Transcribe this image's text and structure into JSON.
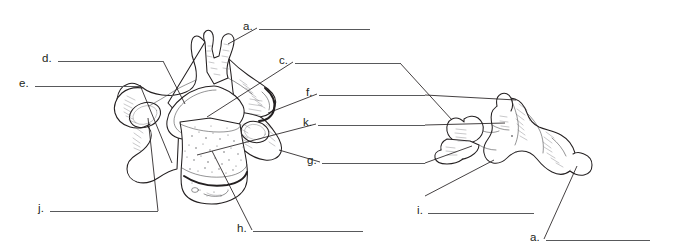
{
  "worksheet": {
    "title": "Vertebra labeling worksheet",
    "figures": [
      {
        "name": "cervical-vertebra-superior-view",
        "description": "Superior view of a cervical vertebra"
      },
      {
        "name": "cervical-vertebra-lateral-view",
        "description": "Lateral view of a cervical vertebra"
      }
    ],
    "colors": {
      "ink": "#231f20",
      "rule": "#58595b",
      "background": "#ffffff"
    },
    "labels": [
      {
        "key": "a_top",
        "letter": "a.",
        "x": 243,
        "y": 21,
        "line_x": 259,
        "line_y": 29,
        "line_w": 111
      },
      {
        "key": "d",
        "letter": "d.",
        "x": 42,
        "y": 53,
        "line_x": 58,
        "line_y": 61,
        "line_w": 105
      },
      {
        "key": "c",
        "letter": "c.",
        "x": 279,
        "y": 55,
        "line_x": 295,
        "line_y": 63,
        "line_w": 105
      },
      {
        "key": "e",
        "letter": "e.",
        "x": 19,
        "y": 78,
        "line_x": 35,
        "line_y": 86,
        "line_w": 105
      },
      {
        "key": "f",
        "letter": "f.",
        "x": 306,
        "y": 87,
        "line_x": 319,
        "line_y": 95,
        "line_w": 106
      },
      {
        "key": "k",
        "letter": "k.",
        "x": 303,
        "y": 117,
        "line_x": 318,
        "line_y": 125,
        "line_w": 107
      },
      {
        "key": "g",
        "letter": "g.",
        "x": 307,
        "y": 155,
        "line_x": 322,
        "line_y": 163,
        "line_w": 103
      },
      {
        "key": "j",
        "letter": "j.",
        "x": 38,
        "y": 203,
        "line_x": 50,
        "line_y": 211,
        "line_w": 108
      },
      {
        "key": "i",
        "letter": "i.",
        "x": 417,
        "y": 205,
        "line_x": 428,
        "line_y": 213,
        "line_w": 106
      },
      {
        "key": "h",
        "letter": "h.",
        "x": 237,
        "y": 223,
        "line_x": 253,
        "line_y": 231,
        "line_w": 110
      },
      {
        "key": "a_bottom",
        "letter": "a.",
        "x": 530,
        "y": 232,
        "line_x": 546,
        "line_y": 240,
        "line_w": 104
      }
    ]
  }
}
